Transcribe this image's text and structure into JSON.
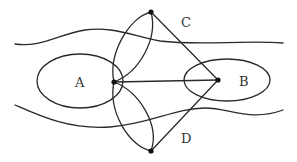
{
  "diagram": {
    "labels": {
      "A": "A",
      "B": "B",
      "C": "C",
      "D": "D"
    },
    "points": {
      "A": {
        "x": 114,
        "y": 82
      },
      "B": {
        "x": 218,
        "y": 80
      },
      "C": {
        "x": 151,
        "y": 12
      },
      "D": {
        "x": 151,
        "y": 151
      }
    },
    "regions": {
      "ellipse_A": {
        "cx": 80,
        "cy": 81,
        "rx": 43,
        "ry": 27
      },
      "ellipse_B": {
        "cx": 227,
        "cy": 80,
        "rx": 43,
        "ry": 21
      }
    },
    "edges": [
      {
        "from": "A",
        "to": "B",
        "type": "line"
      },
      {
        "from": "C",
        "to": "B",
        "type": "line"
      },
      {
        "from": "D",
        "to": "B",
        "type": "line"
      },
      {
        "from": "C",
        "to": "A",
        "type": "lens-curve-pair"
      },
      {
        "from": "A",
        "to": "D",
        "type": "lens-curve-pair"
      }
    ],
    "colors": {
      "stroke": "#2a2a2a",
      "background": "#ffffff"
    }
  }
}
